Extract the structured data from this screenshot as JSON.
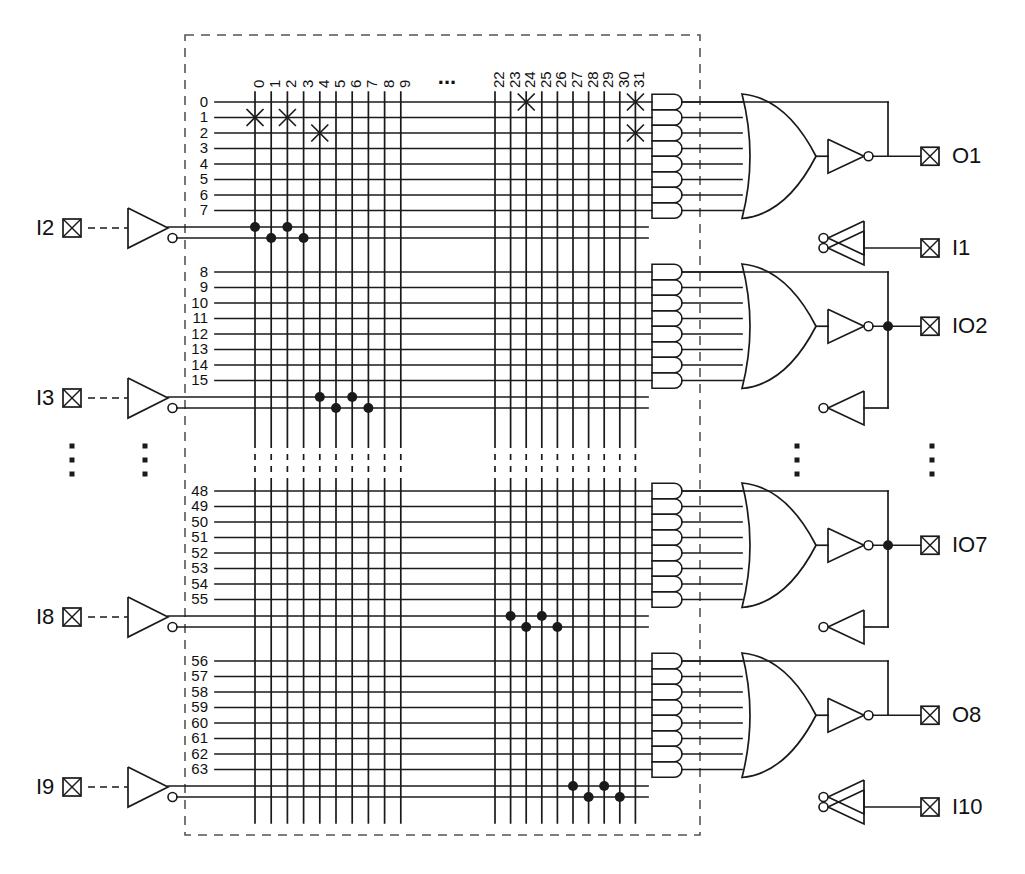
{
  "diagram": {
    "colors": {
      "line": "#1a1a1a",
      "background": "#ffffff",
      "boundary": "#555555"
    },
    "geometry": {
      "boundary": {
        "x": 185,
        "y": 35,
        "w": 515,
        "h": 800
      },
      "col_group_left": {
        "x_start": 255,
        "spacing": 16.2,
        "count": 10
      },
      "col_group_right": {
        "x_start": 495,
        "spacing": 15.6,
        "count": 10
      },
      "row_spacing": 15.5,
      "and_gate": {
        "x": 652,
        "w": 30,
        "h": 15.5
      },
      "grid_x_end": 648
    }
  },
  "column_labels_left": [
    "0",
    "1",
    "2",
    "3",
    "4",
    "5",
    "6",
    "7",
    "8",
    "9"
  ],
  "column_labels_right": [
    "22",
    "23",
    "24",
    "25",
    "26",
    "27",
    "28",
    "29",
    "30",
    "31"
  ],
  "column_gap_ellipsis": "...",
  "row_blocks": [
    {
      "id": "block-1",
      "labels": [
        "0",
        "1",
        "2",
        "3",
        "4",
        "5",
        "6",
        "7"
      ],
      "y_top": 102,
      "output_pin": "O1",
      "output_type": "output",
      "feedback_pin": "I1",
      "feedback_type": "input",
      "input_pin": "I2",
      "has_feedback_link": false,
      "fuse_x_marks": [
        {
          "row": 1,
          "col_group": "left",
          "col": "0"
        },
        {
          "row": 1,
          "col_group": "left",
          "col": "2"
        },
        {
          "row": 2,
          "col_group": "left",
          "col": "4"
        },
        {
          "row": 0,
          "col_group": "right",
          "col": "24"
        },
        {
          "row": 0,
          "col_group": "right",
          "col": "31"
        },
        {
          "row": 2,
          "col_group": "right",
          "col": "31"
        }
      ],
      "input_dots": [
        {
          "line": "true",
          "col_group": "left",
          "col": "0"
        },
        {
          "line": "comp",
          "col_group": "left",
          "col": "1"
        },
        {
          "line": "true",
          "col_group": "left",
          "col": "2"
        },
        {
          "line": "comp",
          "col_group": "left",
          "col": "3"
        }
      ]
    },
    {
      "id": "block-2",
      "labels": [
        "8",
        "9",
        "10",
        "11",
        "12",
        "13",
        "14",
        "15"
      ],
      "y_top": 272,
      "output_pin": "IO2",
      "output_type": "bidirectional",
      "feedback_pin": "",
      "feedback_type": "",
      "input_pin": "I3",
      "has_feedback_link": true,
      "fuse_x_marks": [],
      "input_dots": [
        {
          "line": "true",
          "col_group": "left",
          "col": "4"
        },
        {
          "line": "comp",
          "col_group": "left",
          "col": "5"
        },
        {
          "line": "true",
          "col_group": "left",
          "col": "6"
        },
        {
          "line": "comp",
          "col_group": "left",
          "col": "7"
        }
      ]
    },
    {
      "id": "block-3",
      "labels": [
        "48",
        "49",
        "50",
        "51",
        "52",
        "53",
        "54",
        "55"
      ],
      "y_top": 491,
      "output_pin": "IO7",
      "output_type": "bidirectional",
      "feedback_pin": "",
      "feedback_type": "",
      "input_pin": "I8",
      "has_feedback_link": true,
      "fuse_x_marks": [],
      "input_dots": [
        {
          "line": "true",
          "col_group": "right",
          "col": "23"
        },
        {
          "line": "comp",
          "col_group": "right",
          "col": "24"
        },
        {
          "line": "true",
          "col_group": "right",
          "col": "25"
        },
        {
          "line": "comp",
          "col_group": "right",
          "col": "26"
        }
      ]
    },
    {
      "id": "block-4",
      "labels": [
        "56",
        "57",
        "58",
        "59",
        "60",
        "61",
        "62",
        "63"
      ],
      "y_top": 661,
      "output_pin": "O8",
      "output_type": "output",
      "feedback_pin": "I10",
      "feedback_type": "input",
      "input_pin": "I9",
      "has_feedback_link": false,
      "fuse_x_marks": [],
      "input_dots": [
        {
          "line": "true",
          "col_group": "right",
          "col": "27"
        },
        {
          "line": "comp",
          "col_group": "right",
          "col": "28"
        },
        {
          "line": "true",
          "col_group": "right",
          "col": "29"
        },
        {
          "line": "comp",
          "col_group": "right",
          "col": "30"
        }
      ]
    }
  ],
  "input_pins": [
    {
      "label": "I2",
      "y": 228
    },
    {
      "label": "I3",
      "y": 398
    },
    {
      "label": "I8",
      "y": 617
    },
    {
      "label": "I9",
      "y": 787
    }
  ],
  "output_pins": [
    {
      "label": "O1",
      "y": 155
    },
    {
      "label": "I1",
      "y": 238
    },
    {
      "label": "IO2",
      "y": 325
    },
    {
      "label": "IO7",
      "y": 544
    },
    {
      "label": "O8",
      "y": 714
    },
    {
      "label": "I10",
      "y": 797
    }
  ],
  "ellipsis_markers": [
    {
      "id": "ellipsis-input-pin",
      "x": 72,
      "y": 460,
      "orientation": "vertical"
    },
    {
      "id": "ellipsis-input-buffer",
      "x": 145,
      "y": 460,
      "orientation": "vertical"
    },
    {
      "id": "ellipsis-feedback-buffer",
      "x": 797,
      "y": 460,
      "orientation": "vertical"
    },
    {
      "id": "ellipsis-output-pin",
      "x": 932,
      "y": 460,
      "orientation": "vertical"
    },
    {
      "id": "ellipsis-columns",
      "x": 447,
      "y": 78,
      "orientation": "horizontal"
    }
  ],
  "and_gates_per_block": 8,
  "legend": {
    "x_mark_meaning": "intact fuse / programmed connection",
    "dot_meaning": "hard-wired connection"
  }
}
